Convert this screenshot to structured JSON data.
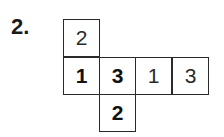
{
  "problem": {
    "number_label": "2."
  },
  "net": {
    "cells": [
      {
        "id": "top",
        "value": "2",
        "bold": false
      },
      {
        "id": "row-1",
        "value": "1",
        "bold": true
      },
      {
        "id": "row-2",
        "value": "3",
        "bold": true
      },
      {
        "id": "row-3",
        "value": "1",
        "bold": false
      },
      {
        "id": "row-4",
        "value": "3",
        "bold": false
      },
      {
        "id": "bottom",
        "value": "2",
        "bold": true
      }
    ]
  }
}
